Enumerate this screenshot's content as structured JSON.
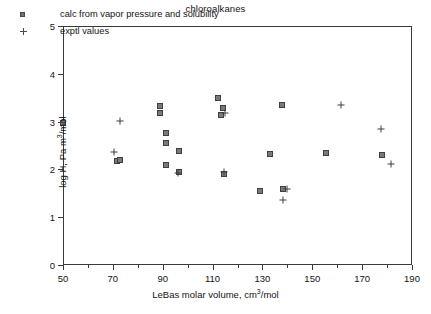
{
  "chart_data": {
    "type": "scatter",
    "title": "chloroalkanes",
    "xlabel": "LeBas molar volume, cm3/mol",
    "xlabel_parts": {
      "pre": "LeBas molar volume, cm",
      "sup": "3",
      "post": "/mol"
    },
    "ylabel": "log H, Pa m3/mol",
    "ylabel_parts": {
      "pre": "log H, Pa m",
      "sup": "3",
      "post": "/mol"
    },
    "xlim": [
      50,
      190
    ],
    "ylim": [
      0,
      5
    ],
    "xticks": [
      50,
      70,
      90,
      110,
      130,
      150,
      170,
      190
    ],
    "xticks_minor": [
      60,
      80,
      100,
      120,
      140,
      160,
      180
    ],
    "yticks": [
      0,
      1,
      2,
      3,
      4,
      5
    ],
    "grid": false,
    "legend_position": "top-left-inside",
    "legend": [
      {
        "marker": "square",
        "label": "calc from vapor pressure and solubility"
      },
      {
        "marker": "plus",
        "label": "exptl values"
      }
    ],
    "series": [
      {
        "name": "calc from vapor pressure and solubility",
        "marker": "square",
        "points": [
          [
            50.0,
            2.98
          ],
          [
            71.6,
            2.18
          ],
          [
            73.0,
            2.2
          ],
          [
            88.8,
            3.32
          ],
          [
            88.8,
            3.17
          ],
          [
            91.4,
            2.77
          ],
          [
            91.4,
            2.55
          ],
          [
            91.4,
            2.09
          ],
          [
            96.5,
            2.38
          ],
          [
            96.5,
            1.94
          ],
          [
            112.0,
            3.5
          ],
          [
            114.0,
            3.28
          ],
          [
            113.2,
            3.14
          ],
          [
            114.6,
            1.91
          ],
          [
            129.0,
            1.54
          ],
          [
            133.0,
            2.33
          ],
          [
            138.0,
            3.34
          ],
          [
            138.2,
            1.58
          ],
          [
            155.5,
            2.34
          ],
          [
            178.0,
            2.3
          ]
        ]
      },
      {
        "name": "exptl values",
        "marker": "plus",
        "points": [
          [
            72.8,
            3.02
          ],
          [
            70.4,
            2.36
          ],
          [
            114.8,
            3.18
          ],
          [
            96.2,
            1.92
          ],
          [
            114.4,
            1.94
          ],
          [
            139.8,
            1.6
          ],
          [
            138.4,
            1.36
          ],
          [
            161.5,
            3.34
          ],
          [
            177.6,
            2.84
          ],
          [
            181.5,
            2.12
          ]
        ]
      }
    ]
  }
}
